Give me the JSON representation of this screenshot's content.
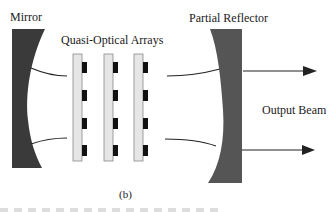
{
  "diagram": {
    "labels": {
      "mirror": "Mirror",
      "arrays": "Quasi-Optical Arrays",
      "partial_reflector": "Partial Reflector",
      "output_beam": "Output Beam",
      "caption": "(b)"
    },
    "components": {
      "mirror": {
        "shape": "concave-mirror",
        "color": "#3a3a3a"
      },
      "array_panels": {
        "count": 3,
        "color": "#e6e6e6",
        "elements_per_panel": 4,
        "element_color": "#111111"
      },
      "partial_reflector": {
        "shape": "concave-reflector",
        "color": "#555555"
      },
      "output_arrows": {
        "count": 2
      }
    }
  }
}
